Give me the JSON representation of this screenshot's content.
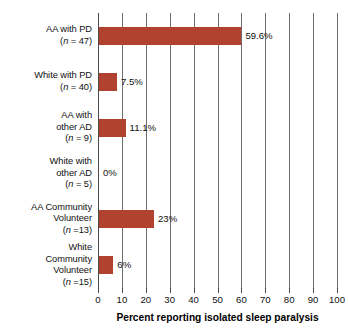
{
  "chart_data": {
    "type": "bar",
    "orientation": "horizontal",
    "title": "",
    "xlabel": "Percent reporting isolated sleep paralysis",
    "ylabel": "",
    "xlim": [
      0,
      100
    ],
    "xticks": [
      0,
      10,
      20,
      30,
      40,
      50,
      60,
      70,
      80,
      90,
      100
    ],
    "xtick_labels": [
      "0",
      "10",
      "20",
      "30",
      "40",
      "50",
      "60",
      "70",
      "80",
      "90",
      "100"
    ],
    "grid": true,
    "legend": false,
    "bar_color": "#b0422f",
    "categories": [
      "AA with PD (n = 47)",
      "White with PD (n = 40)",
      "AA with other AD (n = 9)",
      "White with other AD (n = 5)",
      "AA Community Volunteer (n =13)",
      "White Community Volunteer (n =15)"
    ],
    "values": [
      59.6,
      7.5,
      11.1,
      0,
      23,
      6
    ],
    "value_labels": [
      "59.6%",
      "7.5%",
      "11.1%",
      "0%",
      "23%",
      "6%"
    ],
    "n_values": [
      47,
      40,
      9,
      5,
      13,
      15
    ],
    "rows": [
      {
        "lines": [
          "AA with PD"
        ],
        "n_prefix": "(",
        "n_italic": "n",
        "n_suffix": " = 47)",
        "value": 59.6,
        "value_label": "59.6%"
      },
      {
        "lines": [
          "White with PD"
        ],
        "n_prefix": "(",
        "n_italic": "n",
        "n_suffix": " = 40)",
        "value": 7.5,
        "value_label": "7.5%"
      },
      {
        "lines": [
          "AA with",
          "other AD"
        ],
        "n_prefix": "(",
        "n_italic": "n",
        "n_suffix": " = 9)",
        "value": 11.1,
        "value_label": "11.1%"
      },
      {
        "lines": [
          "White with",
          "other AD"
        ],
        "n_prefix": "(",
        "n_italic": "n",
        "n_suffix": " = 5)",
        "value": 0,
        "value_label": "0%"
      },
      {
        "lines": [
          "AA Community",
          "Volunteer"
        ],
        "n_prefix": "(",
        "n_italic": "n",
        "n_suffix": " =13)",
        "value": 23,
        "value_label": "23%"
      },
      {
        "lines": [
          "White",
          "Community",
          "Volunteer"
        ],
        "n_prefix": "(",
        "n_italic": "n",
        "n_suffix": " =15)",
        "value": 6,
        "value_label": "6%"
      }
    ]
  }
}
